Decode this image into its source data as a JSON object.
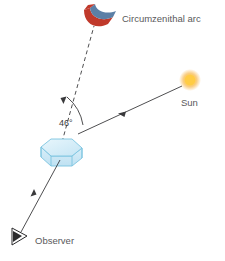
{
  "figure": {
    "background_color": "#ffffff",
    "title": "",
    "labels": {
      "arc": "Circumzenithal arc",
      "sun": "Sun",
      "observer": "Observer",
      "angle": "46°"
    },
    "colors": {
      "arc_outer_red": "#c0392b",
      "arc_inner_blue": "#5b7fa6",
      "sun_core": "#ffd24d",
      "sun_glow": "#f5a623",
      "crystal_fill": "#d7edf7",
      "crystal_stroke": "#7cc4e0",
      "crystal_top": "#cfe9f6",
      "line_color": "#3a3a3c",
      "text_color": "#59595b"
    },
    "elements": [
      {
        "name": "circumzenithal-arc",
        "kind": "curved-band",
        "position": {
          "x": 95,
          "y": 16
        }
      },
      {
        "name": "sun",
        "kind": "glowing-disc",
        "position": {
          "x": 190,
          "y": 80
        },
        "radius": 8
      },
      {
        "name": "hexagonal-plate-crystal",
        "kind": "hexagonal-prism",
        "position": {
          "x": 62,
          "y": 153
        }
      },
      {
        "name": "observer",
        "kind": "eye-cone-symbol",
        "position": {
          "x": 16,
          "y": 236
        }
      }
    ],
    "rays": [
      {
        "name": "sun-ray",
        "style": "solid",
        "from": {
          "x": 182,
          "y": 86
        },
        "to": {
          "x": 78,
          "y": 135
        },
        "arrow": "midpoint-toward-crystal"
      },
      {
        "name": "refracted-ray-to-arc",
        "style": "dashed",
        "from": {
          "x": 62,
          "y": 140
        },
        "to": {
          "x": 95,
          "y": 28
        },
        "arrow": "toward-crystal"
      },
      {
        "name": "observer-ray",
        "style": "solid",
        "from": {
          "x": 58,
          "y": 168
        },
        "to": {
          "x": 20,
          "y": 234
        },
        "arrow": "toward-observer"
      }
    ],
    "angle_arc": {
      "name": "forty-six-degree-angle",
      "value": "46°",
      "between": [
        "refracted-ray-to-arc",
        "sun-ray"
      ]
    }
  }
}
